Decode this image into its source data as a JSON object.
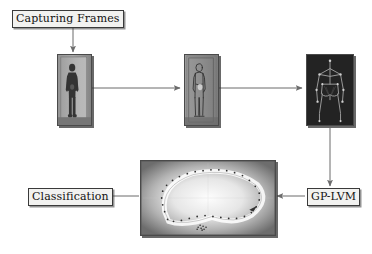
{
  "diagram": {
    "background_color": "#ffffff",
    "line_color": "#6b6b6b",
    "label_border_color": "#3a3a3a",
    "label_fill_color": "#f2f2f0"
  },
  "labels": {
    "capturing_frames": "Capturing Frames",
    "gp_lvm": "GP-LVM",
    "classification": "Classification"
  },
  "panels": [
    {
      "id": "raw-frame",
      "caption": "raw video frame of standing person in doorway",
      "kind": "photo-grayscale"
    },
    {
      "id": "edge-frame",
      "caption": "edge/contour processed frame of person",
      "kind": "edge-map"
    },
    {
      "id": "skeleton-frame",
      "caption": "extracted skeleton pose on dark background",
      "kind": "skeleton"
    },
    {
      "id": "latent-space-plot",
      "caption": "GP-LVM latent space with cyclic gait trajectory",
      "kind": "latent-manifold"
    }
  ],
  "arrows": [
    {
      "id": "capturing-to-frame1",
      "from": "Capturing Frames",
      "to": "raw-frame",
      "direction": "down"
    },
    {
      "id": "frame1-to-frame2",
      "from": "raw-frame",
      "to": "edge-frame",
      "direction": "right"
    },
    {
      "id": "frame2-to-frame3",
      "from": "edge-frame",
      "to": "skeleton-frame",
      "direction": "right"
    },
    {
      "id": "frame3-to-gplvm",
      "from": "skeleton-frame",
      "to": "GP-LVM",
      "direction": "down"
    },
    {
      "id": "gplvm-to-latent",
      "from": "GP-LVM",
      "to": "latent-space-plot",
      "direction": "left"
    },
    {
      "id": "latent-to-classification",
      "from": "latent-space-plot",
      "to": "Classification",
      "direction": "left"
    }
  ]
}
